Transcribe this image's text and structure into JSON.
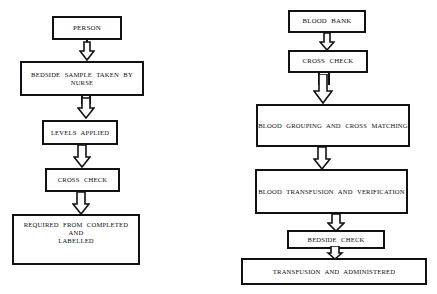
{
  "diagram": {
    "background_color": "#ffffff",
    "line_color": "#111111",
    "text_color": "#0d0d0d",
    "columns": [
      {
        "name": "patient-side",
        "nodes": [
          {
            "id": "person",
            "label": "PERSON"
          },
          {
            "id": "bedside-sample",
            "label": "BEDSIDE  SAMPLE  TAKEN BY\nNURSE"
          },
          {
            "id": "levels-applied",
            "label": "LEVELS   APPLIED"
          },
          {
            "id": "cross-check-left",
            "label": "CROSS CHECK"
          },
          {
            "id": "required-from",
            "label": "REQUIRED  FROM  COMPLETED\nAND\nLABELLED"
          }
        ]
      },
      {
        "name": "blood-bank-side",
        "nodes": [
          {
            "id": "blood-bank",
            "label": "BLOOD  BANK"
          },
          {
            "id": "cross-check-right",
            "label": "CROSS CHECK"
          },
          {
            "id": "blood-grouping",
            "label": "BLOOD  GROUPING  AND  CROSS  MATCHING"
          },
          {
            "id": "blood-transfusion",
            "label": "BLOOD  TRANSFUSION  AND  VERIFICATION"
          },
          {
            "id": "bedside-check",
            "label": "BEDSIDE  CHECK"
          },
          {
            "id": "transfusion-admin",
            "label": "TRANSFUSION  AND  ADMINISTERED"
          }
        ]
      }
    ],
    "connectors": [
      {
        "id": "arrow-person-to-bedside-sample",
        "from": "person",
        "to": "bedside-sample",
        "style": "hollow-block-arrow-down"
      },
      {
        "id": "arrow-bedside-sample-to-levels",
        "from": "bedside-sample",
        "to": "levels-applied",
        "style": "hollow-block-arrow-down"
      },
      {
        "id": "arrow-levels-to-cross-check",
        "from": "levels-applied",
        "to": "cross-check-left",
        "style": "hollow-block-arrow-down"
      },
      {
        "id": "arrow-cross-check-to-required",
        "from": "cross-check-left",
        "to": "required-from",
        "style": "hollow-block-arrow-down"
      },
      {
        "id": "arrow-blood-bank-to-cross-check",
        "from": "blood-bank",
        "to": "cross-check-right",
        "style": "hollow-block-arrow-down"
      },
      {
        "id": "arrow-cross-check-to-grouping",
        "from": "cross-check-right",
        "to": "blood-grouping",
        "style": "hollow-block-arrow-down"
      },
      {
        "id": "arrow-grouping-to-transfusion",
        "from": "blood-grouping",
        "to": "blood-transfusion",
        "style": "hollow-block-arrow-down"
      },
      {
        "id": "arrow-transfusion-to-bedside-check",
        "from": "blood-transfusion",
        "to": "bedside-check",
        "style": "hollow-block-arrow-down"
      },
      {
        "id": "arrow-bedside-check-to-admin",
        "from": "bedside-check",
        "to": "transfusion-admin",
        "style": "hollow-block-arrow-down"
      }
    ]
  }
}
